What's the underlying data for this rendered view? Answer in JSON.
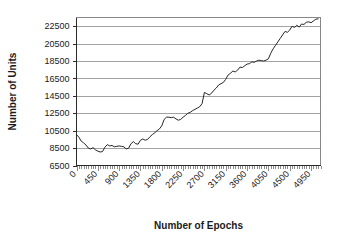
{
  "chart_data": {
    "type": "line",
    "title": "",
    "xlabel": "Number of Epochs",
    "ylabel": "Number of Units",
    "xlim": [
      0,
      5150
    ],
    "ylim": [
      6500,
      23500
    ],
    "grid": true,
    "legend": false,
    "x_ticks": [
      "0",
      "450",
      "900",
      "1350",
      "1800",
      "2250",
      "2700",
      "3150",
      "3600",
      "4050",
      "4500",
      "4950"
    ],
    "x_tick_values": [
      0,
      450,
      900,
      1350,
      1800,
      2250,
      2700,
      3150,
      3600,
      4050,
      4500,
      4950
    ],
    "y_ticks": [
      "6500",
      "8500",
      "10500",
      "12500",
      "14500",
      "16500",
      "18500",
      "20500",
      "22500"
    ],
    "y_tick_values": [
      6500,
      8500,
      10500,
      12500,
      14500,
      16500,
      18500,
      20500,
      22500
    ],
    "series": [
      {
        "name": "Number of Units",
        "color": "#262626",
        "x": [
          0,
          50,
          100,
          150,
          200,
          250,
          300,
          350,
          400,
          450,
          500,
          550,
          600,
          650,
          700,
          750,
          800,
          850,
          900,
          950,
          1000,
          1050,
          1100,
          1150,
          1200,
          1250,
          1300,
          1350,
          1400,
          1450,
          1500,
          1550,
          1600,
          1650,
          1700,
          1750,
          1800,
          1850,
          1900,
          1950,
          2000,
          2050,
          2100,
          2150,
          2200,
          2250,
          2300,
          2350,
          2400,
          2450,
          2500,
          2550,
          2600,
          2650,
          2700,
          2750,
          2800,
          2850,
          2900,
          2950,
          3000,
          3050,
          3100,
          3150,
          3200,
          3250,
          3300,
          3350,
          3400,
          3450,
          3500,
          3550,
          3600,
          3650,
          3700,
          3750,
          3800,
          3850,
          3900,
          3950,
          4000,
          4050,
          4100,
          4150,
          4200,
          4250,
          4300,
          4350,
          4400,
          4450,
          4500,
          4550,
          4600,
          4650,
          4700,
          4750,
          4800,
          4850,
          4900,
          4950,
          5000,
          5050,
          5100
        ],
        "values": [
          10050,
          9750,
          9300,
          9100,
          8850,
          8500,
          8400,
          8550,
          8300,
          8150,
          8050,
          8100,
          8600,
          8900,
          8750,
          8800,
          8650,
          8700,
          8750,
          8700,
          8650,
          8400,
          8500,
          9000,
          9250,
          9000,
          8950,
          9400,
          9550,
          9400,
          9500,
          9800,
          10050,
          10250,
          10500,
          10700,
          11050,
          11800,
          12050,
          12050,
          12000,
          12050,
          11850,
          11700,
          11800,
          12050,
          12250,
          12500,
          12600,
          12800,
          12950,
          13100,
          13250,
          13600,
          14900,
          14750,
          14600,
          14800,
          15150,
          15400,
          15750,
          15900,
          16050,
          16400,
          16900,
          17100,
          17350,
          17250,
          17450,
          17800,
          17750,
          17950,
          18150,
          18200,
          18400,
          18350,
          18500,
          18600,
          18550,
          18500,
          18600,
          18750,
          19400,
          19900,
          20300,
          20700,
          21100,
          21500,
          21900,
          21800,
          22050,
          22500,
          22350,
          22600,
          22400,
          22750,
          22700,
          22950,
          23000,
          22900,
          23100,
          23300,
          23350
        ]
      }
    ]
  },
  "labels": {
    "y_axis_title": "Number of Units",
    "x_axis_title": "Number of Epochs"
  }
}
